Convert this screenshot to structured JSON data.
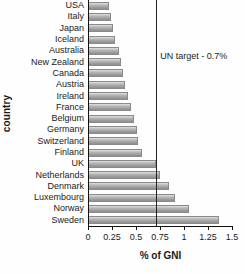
{
  "chart_data": {
    "type": "bar",
    "orientation": "horizontal",
    "title": "",
    "xlabel": "% of GNI",
    "ylabel": "country",
    "xlim": [
      0,
      1.5
    ],
    "grid": false,
    "legend": null,
    "xticks": [
      "0",
      "0.25",
      "0.5",
      "0.75",
      "1",
      "1.25",
      "1.5"
    ],
    "xtick_values": [
      0,
      0.25,
      0.5,
      0.75,
      1,
      1.25,
      1.5
    ],
    "categories": [
      "USA",
      "Italy",
      "Japan",
      "Iceland",
      "Australia",
      "New Zealand",
      "Canada",
      "Austria",
      "Ireland",
      "France",
      "Belgium",
      "Germany",
      "Switzerland",
      "Finland",
      "UK",
      "Netherlands",
      "Denmark",
      "Luxembourg",
      "Norway",
      "Sweden"
    ],
    "values": [
      0.21,
      0.23,
      0.25,
      0.27,
      0.31,
      0.33,
      0.35,
      0.37,
      0.41,
      0.44,
      0.47,
      0.5,
      0.51,
      0.55,
      0.7,
      0.74,
      0.83,
      0.9,
      1.04,
      1.35
    ],
    "annotations": [
      {
        "name": "un-target",
        "label": "UN target - 0.7%",
        "value": 0.7,
        "type": "vertical-reference-line"
      }
    ],
    "colors": {
      "bar_light": "#e8e8e8",
      "bar_mid": "#b0b0b0",
      "bar_dark": "#8e8e8e",
      "axis": "#111111",
      "text": "#1a1a1a",
      "background": "#fefefe"
    }
  }
}
